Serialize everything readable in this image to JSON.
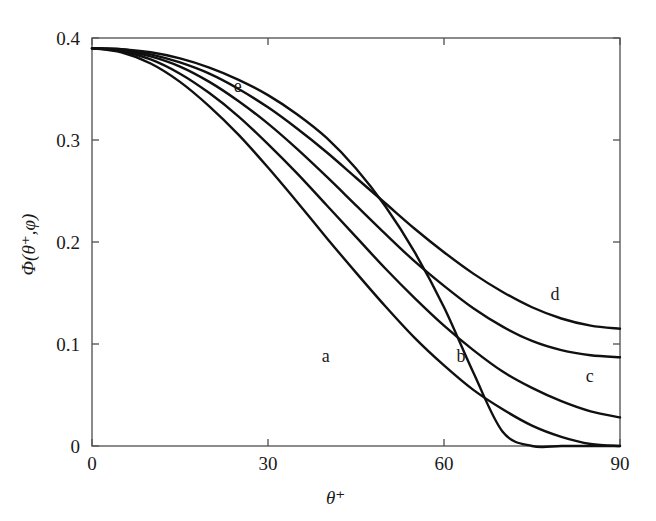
{
  "chart_data": {
    "type": "line",
    "title": "",
    "subtitle": "",
    "xlabel": "θ⁺",
    "ylabel": "Φ(θ⁺,φ)",
    "xlim": [
      0,
      90
    ],
    "ylim": [
      0,
      0.4
    ],
    "xticks": [
      0,
      30,
      60,
      90
    ],
    "yticks": [
      0,
      0.1,
      0.2,
      0.3,
      0.4
    ],
    "xtick_labels": [
      "0",
      "30",
      "60",
      "90"
    ],
    "ytick_labels": [
      "0",
      "0.1",
      "0.2",
      "0.3",
      "0.4"
    ],
    "grid": false,
    "legend_position": "inline-annotations",
    "line_color": "#101010",
    "background_color": "#ffffff",
    "axis_color": "#555555",
    "x": [
      0,
      5,
      10,
      15,
      20,
      25,
      30,
      35,
      40,
      45,
      50,
      55,
      60,
      65,
      70,
      75,
      80,
      85,
      90
    ],
    "series": [
      {
        "name": "a",
        "label": "a",
        "label_x": 40,
        "label_y": 0.087,
        "values": [
          0.39,
          0.386,
          0.375,
          0.357,
          0.333,
          0.305,
          0.273,
          0.239,
          0.204,
          0.17,
          0.137,
          0.106,
          0.079,
          0.055,
          0.036,
          0.02,
          0.009,
          0.002,
          0.0
        ]
      },
      {
        "name": "b",
        "label": "b",
        "label_x": 63,
        "label_y": 0.087,
        "values": [
          0.39,
          0.387,
          0.379,
          0.365,
          0.346,
          0.323,
          0.296,
          0.267,
          0.236,
          0.205,
          0.174,
          0.145,
          0.118,
          0.094,
          0.073,
          0.057,
          0.044,
          0.034,
          0.028
        ]
      },
      {
        "name": "c",
        "label": "c",
        "label_x": 85,
        "label_y": 0.068,
        "values": [
          0.39,
          0.388,
          0.382,
          0.372,
          0.357,
          0.338,
          0.316,
          0.291,
          0.264,
          0.236,
          0.208,
          0.181,
          0.157,
          0.135,
          0.117,
          0.103,
          0.094,
          0.089,
          0.087
        ]
      },
      {
        "name": "d",
        "label": "d",
        "label_x": 79,
        "label_y": 0.148,
        "values": [
          0.39,
          0.389,
          0.384,
          0.376,
          0.365,
          0.35,
          0.332,
          0.311,
          0.288,
          0.263,
          0.238,
          0.213,
          0.19,
          0.169,
          0.151,
          0.136,
          0.125,
          0.118,
          0.115
        ]
      },
      {
        "name": "e",
        "label": "e",
        "label_x": 25,
        "label_y": 0.352,
        "values": [
          0.39,
          0.389,
          0.386,
          0.38,
          0.371,
          0.359,
          0.344,
          0.325,
          0.302,
          0.272,
          0.235,
          0.19,
          0.136,
          0.072,
          0.014,
          0.0,
          0.0,
          0.0,
          0.0
        ]
      }
    ],
    "annotations": [
      {
        "text": "e",
        "x": 25,
        "y": 0.352
      },
      {
        "text": "a",
        "x": 40,
        "y": 0.087
      },
      {
        "text": "b",
        "x": 63,
        "y": 0.087
      },
      {
        "text": "c",
        "x": 85,
        "y": 0.068
      },
      {
        "text": "d",
        "x": 79,
        "y": 0.148
      }
    ]
  }
}
